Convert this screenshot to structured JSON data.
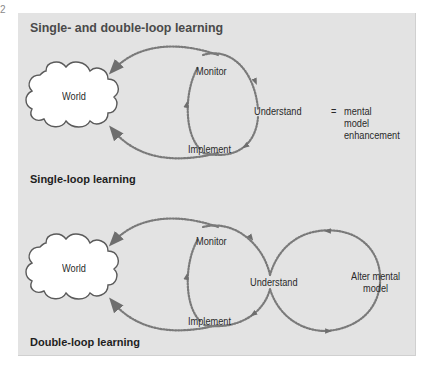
{
  "figure_number": "2",
  "panel": {
    "title": "Single- and double-loop learning",
    "background": "#e3e3e3",
    "dot_color": "#7a7a7a"
  },
  "single_loop": {
    "label": "Single-loop learning",
    "world": "World",
    "monitor": "Monitor",
    "implement": "Implement",
    "understand": "Understand",
    "equals": "=",
    "result_lines": [
      "mental",
      "model",
      "enhancement"
    ]
  },
  "double_loop": {
    "label": "Double-loop learning",
    "world": "World",
    "monitor": "Monitor",
    "implement": "Implement",
    "understand": "Understand",
    "alter_lines": [
      "Alter mental",
      "model"
    ]
  }
}
